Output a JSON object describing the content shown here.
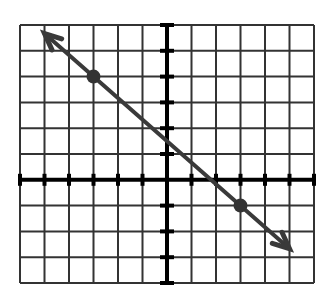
{
  "chart_data": {
    "type": "line",
    "title": "",
    "xlabel": "",
    "ylabel": "",
    "grid": true,
    "xlim": [
      -6,
      6
    ],
    "ylim": [
      -4,
      6
    ],
    "tick_labels": false,
    "points": [
      {
        "x": -3,
        "y": 4
      },
      {
        "x": 3,
        "y": -1
      }
    ],
    "line": {
      "slope": -0.8333,
      "intercept": 1.5,
      "arrow_start": {
        "x": -5,
        "y": 5.67
      },
      "arrow_end": {
        "x": 5,
        "y": -2.67
      },
      "arrows_both_ends": true
    },
    "colors": {
      "grid": "#333333",
      "axis": "#000000",
      "line": "#3a3a3a",
      "point": "#333333"
    }
  }
}
